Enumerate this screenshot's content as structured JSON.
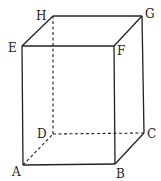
{
  "diagram": {
    "type": "rectangular-prism",
    "vertices": {
      "A": {
        "label": "A",
        "x": 23,
        "y": 165
      },
      "B": {
        "label": "B",
        "x": 115,
        "y": 164
      },
      "C": {
        "label": "C",
        "x": 144,
        "y": 133
      },
      "D": {
        "label": "D",
        "x": 53,
        "y": 134
      },
      "E": {
        "label": "E",
        "x": 22,
        "y": 46
      },
      "F": {
        "label": "F",
        "x": 114,
        "y": 46
      },
      "G": {
        "label": "G",
        "x": 142,
        "y": 16
      },
      "H": {
        "label": "H",
        "x": 53,
        "y": 16
      }
    },
    "solid_edges": [
      "AB",
      "BC",
      "CG",
      "GH",
      "HE",
      "EF",
      "FG",
      "FB",
      "EA"
    ],
    "hidden_edges": [
      "AD",
      "DC",
      "DH"
    ],
    "line_color": "#222222"
  }
}
